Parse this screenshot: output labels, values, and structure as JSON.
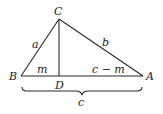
{
  "diagram": {
    "type": "triangle-with-altitude",
    "vertices": {
      "A": {
        "label": "A"
      },
      "B": {
        "label": "B"
      },
      "C": {
        "label": "C"
      },
      "D": {
        "label": "D"
      }
    },
    "side_labels": {
      "a": "a",
      "b": "b",
      "c": "c",
      "m": "m",
      "c_minus_m": "c − m"
    }
  }
}
